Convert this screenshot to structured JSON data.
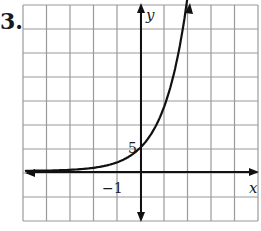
{
  "problem_label": "3.",
  "colors": {
    "grid": "#9a9a9a",
    "axis": "#111111",
    "curve": "#111111"
  },
  "chart_data": {
    "type": "line",
    "title": "",
    "xlabel": "x",
    "ylabel": "y",
    "tick_labels": {
      "x": [
        "-1"
      ],
      "y": [
        "5"
      ]
    },
    "x_unit_per_grid": 1,
    "y_unit_per_grid": 5,
    "xlim": [
      -5,
      5
    ],
    "ylim": [
      -10,
      35
    ],
    "grid": true,
    "legend": "none",
    "series": [
      {
        "name": "f(x)",
        "description": "increasing exponential curve, approx y = 5·e^x; horizontal asymptote y = 0 on the left; y-intercept ≈ 5",
        "x": [
          -5,
          -4,
          -3,
          -2,
          -1,
          -0.5,
          0,
          0.5,
          1,
          1.5,
          2.1
        ],
        "values": [
          0.03,
          0.1,
          0.25,
          0.7,
          1.8,
          3.0,
          5.0,
          8.2,
          13.6,
          22.4,
          34.8
        ]
      }
    ]
  },
  "geometry": {
    "grid": {
      "left": 23,
      "top": 5,
      "col_w": 23.5,
      "row_h": 24,
      "cols": 10,
      "rows": 9
    },
    "origin_px": [
      141,
      172
    ]
  },
  "labels": {
    "x_axis": "x",
    "y_axis": "y",
    "x_tick": "−1",
    "y_tick": "5"
  }
}
